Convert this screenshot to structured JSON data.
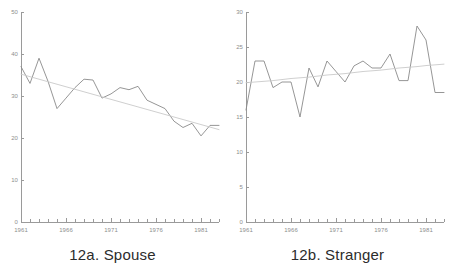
{
  "figure": {
    "panels": [
      {
        "id": "spouse",
        "caption": "12a. Spouse"
      },
      {
        "id": "stranger",
        "caption": "12b. Stranger"
      }
    ]
  },
  "colors": {
    "data_line": "#8a8a8a",
    "trend_line": "#c9c9c9",
    "axis": "#9a9a9a",
    "tick_label": "#8e8e8e",
    "caption": "#2c2c2c",
    "background": "#ffffff"
  },
  "chart_data": [
    {
      "type": "line",
      "id": "spouse",
      "title": "12a. Spouse",
      "xlabel": "",
      "ylabel": "",
      "xlim": [
        1961,
        1983
      ],
      "ylim": [
        0,
        50
      ],
      "yticks": [
        0,
        10,
        20,
        30,
        40,
        50
      ],
      "ytick_labels": [
        "0",
        "10",
        "20",
        "30",
        "40",
        "50"
      ],
      "xticks": [
        1961,
        1966,
        1971,
        1976,
        1981
      ],
      "xtick_labels": [
        "1961",
        "1966",
        "1971",
        "1976",
        "1981"
      ],
      "minor_xticks_every": 1,
      "grid": false,
      "legend": "none",
      "x": [
        1961,
        1962,
        1963,
        1964,
        1965,
        1966,
        1967,
        1968,
        1969,
        1970,
        1971,
        1972,
        1973,
        1974,
        1975,
        1976,
        1977,
        1978,
        1979,
        1980,
        1981,
        1982,
        1983
      ],
      "series": [
        {
          "name": "Spouse",
          "style": "solid",
          "values": [
            37.0,
            33.0,
            39.0,
            33.5,
            27.0,
            29.5,
            32.0,
            34.0,
            33.8,
            29.5,
            30.5,
            32.0,
            31.5,
            32.3,
            29.0,
            28.0,
            27.0,
            24.0,
            22.5,
            23.5,
            20.5,
            23.0,
            23.0
          ]
        },
        {
          "name": "Trend",
          "style": "trend",
          "values": [
            35.2,
            34.6,
            34.0,
            33.4,
            32.8,
            32.2,
            31.6,
            31.0,
            30.4,
            29.8,
            29.2,
            28.6,
            28.0,
            27.4,
            26.8,
            26.2,
            25.6,
            25.0,
            24.4,
            23.8,
            23.2,
            22.6,
            22.0
          ]
        }
      ]
    },
    {
      "type": "line",
      "id": "stranger",
      "title": "12b. Stranger",
      "xlabel": "",
      "ylabel": "",
      "xlim": [
        1961,
        1983
      ],
      "ylim": [
        0,
        30
      ],
      "yticks": [
        0,
        5,
        10,
        15,
        20,
        25,
        30
      ],
      "ytick_labels": [
        "0",
        "5",
        "10",
        "15",
        "20",
        "25",
        "30"
      ],
      "xticks": [
        1961,
        1966,
        1971,
        1976,
        1981
      ],
      "xtick_labels": [
        "1961",
        "1966",
        "1971",
        "1976",
        "1981"
      ],
      "minor_xticks_every": 1,
      "grid": false,
      "legend": "none",
      "x": [
        1961,
        1962,
        1963,
        1964,
        1965,
        1966,
        1967,
        1968,
        1969,
        1970,
        1971,
        1972,
        1973,
        1974,
        1975,
        1976,
        1977,
        1978,
        1979,
        1980,
        1981,
        1982,
        1983
      ],
      "series": [
        {
          "name": "Stranger",
          "style": "solid",
          "values": [
            16.0,
            23.0,
            23.0,
            19.2,
            20.0,
            20.0,
            15.0,
            22.0,
            19.3,
            23.0,
            21.5,
            20.0,
            22.3,
            23.0,
            22.0,
            22.0,
            24.0,
            20.2,
            20.2,
            28.0,
            26.0,
            18.5,
            18.5
          ]
        },
        {
          "name": "Trend",
          "style": "trend",
          "values": [
            19.9,
            20.0,
            20.1,
            20.2,
            20.35,
            20.5,
            20.6,
            20.7,
            20.85,
            21.0,
            21.1,
            21.2,
            21.35,
            21.5,
            21.6,
            21.7,
            21.85,
            22.0,
            22.1,
            22.2,
            22.35,
            22.45,
            22.55
          ]
        }
      ]
    }
  ]
}
